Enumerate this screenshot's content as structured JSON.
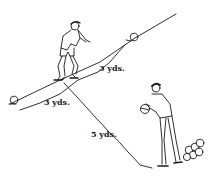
{
  "diagram": {
    "labels": {
      "upper_distance": "3 yds.",
      "lower_distance": "3 yds.",
      "side_distance": "5 yds."
    },
    "elements": {
      "player_on_line": "player straddling diagonal line",
      "player_with_ball": "player holding ball",
      "ball_upper_right": "ball",
      "ball_lower_left": "ball",
      "ball_pile": "pile of balls"
    },
    "colors": {
      "ink": "#1a1a1a",
      "background": "#ffffff"
    }
  }
}
